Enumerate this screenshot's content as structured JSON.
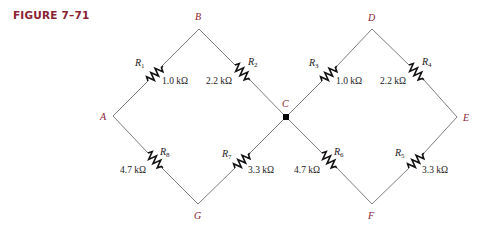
{
  "figure": {
    "title": "FIGURE 7–71",
    "accent_color": "#8a2233"
  },
  "nodes": [
    {
      "id": "A",
      "label": "A"
    },
    {
      "id": "B",
      "label": "B"
    },
    {
      "id": "C",
      "label": "C"
    },
    {
      "id": "D",
      "label": "D"
    },
    {
      "id": "E",
      "label": "E"
    },
    {
      "id": "F",
      "label": "F"
    },
    {
      "id": "G",
      "label": "G"
    }
  ],
  "resistors": [
    {
      "name": "R",
      "sub": "1",
      "value": "1.0 kΩ",
      "between": [
        "A",
        "B"
      ]
    },
    {
      "name": "R",
      "sub": "2",
      "value": "2.2 kΩ",
      "between": [
        "B",
        "C"
      ]
    },
    {
      "name": "R",
      "sub": "3",
      "value": "1.0 kΩ",
      "between": [
        "C",
        "D"
      ]
    },
    {
      "name": "R",
      "sub": "4",
      "value": "2.2 kΩ",
      "between": [
        "D",
        "E"
      ]
    },
    {
      "name": "R",
      "sub": "5",
      "value": "3.3 kΩ",
      "between": [
        "E",
        "F"
      ]
    },
    {
      "name": "R",
      "sub": "6",
      "value": "4.7 kΩ",
      "between": [
        "C",
        "F"
      ]
    },
    {
      "name": "R",
      "sub": "7",
      "value": "3.3 kΩ",
      "between": [
        "G",
        "C"
      ]
    },
    {
      "name": "R",
      "sub": "8",
      "value": "4.7 kΩ",
      "between": [
        "A",
        "G"
      ]
    }
  ],
  "junctions": [
    {
      "node": "C",
      "dot": true
    }
  ]
}
